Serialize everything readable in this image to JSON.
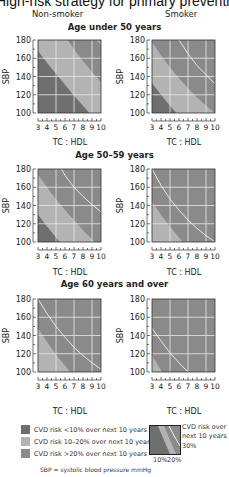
{
  "page": {
    "title": "High-risk strategy for primary prevention: a pro",
    "columns": [
      "Non-smoker",
      "Smoker"
    ],
    "age_groups": [
      "Age under 50 years",
      "Age 50–59 years",
      "Age 60 years and over"
    ],
    "x_axis_label": "TC : HDL",
    "y_axis_label": "SBP",
    "footnote": "SBP = systolic blood pressure mmHg"
  },
  "legend": {
    "items": [
      {
        "label": "CVD risk <10% over next 10 years",
        "color": "#6f6f6f"
      },
      {
        "label": "CVD risk 10–20% over next 10 years",
        "color": "#b3b3b3"
      },
      {
        "label": "CVD risk >20% over next 10 years",
        "color": "#8a8a8a"
      }
    ],
    "key": {
      "text_lines": [
        "CVD risk over",
        "next 10 years"
      ],
      "label_30": "30%",
      "label_10": "10%",
      "label_20": "20%"
    }
  },
  "colors": {
    "low": "#6f6f6f",
    "mid": "#b3b3b3",
    "high": "#8a8a8a",
    "grid": "#e8e8e8",
    "line30": "#f2f2f2"
  },
  "chart_data": [
    {
      "type": "area",
      "title": "Non-smoker, Age under 50 years",
      "xlabel": "TC : HDL",
      "ylabel": "SBP",
      "xlim": [
        3,
        10
      ],
      "ylim": [
        100,
        180
      ],
      "x_ticks": [
        3,
        4,
        5,
        6,
        7,
        8,
        9,
        10
      ],
      "y_ticks": [
        100,
        120,
        140,
        160,
        180
      ],
      "grid": true,
      "boundaries": {
        "10%": [
          [
            3,
            168
          ],
          [
            4,
            155
          ],
          [
            5,
            143
          ],
          [
            6,
            131
          ],
          [
            7,
            119
          ],
          [
            8,
            108
          ],
          [
            8.7,
            100
          ]
        ],
        "20%": [
          [
            6.3,
            180
          ],
          [
            7,
            170
          ],
          [
            8,
            157
          ],
          [
            9,
            145
          ],
          [
            10,
            134
          ]
        ],
        "30%": [
          [
            9.6,
            180
          ],
          [
            10,
            176
          ]
        ]
      }
    },
    {
      "type": "area",
      "title": "Smoker, Age under 50 years",
      "xlabel": "TC : HDL",
      "ylabel": "SBP",
      "xlim": [
        3,
        10
      ],
      "ylim": [
        100,
        180
      ],
      "x_ticks": [
        3,
        4,
        5,
        6,
        7,
        8,
        9,
        10
      ],
      "y_ticks": [
        100,
        120,
        140,
        160,
        180
      ],
      "grid": true,
      "boundaries": {
        "10%": [
          [
            3,
            133
          ],
          [
            4,
            120
          ],
          [
            5,
            108
          ],
          [
            5.7,
            100
          ]
        ],
        "20%": [
          [
            3,
            178
          ],
          [
            4,
            163
          ],
          [
            5,
            150
          ],
          [
            6,
            138
          ],
          [
            7,
            127
          ],
          [
            8,
            117
          ],
          [
            9,
            108
          ],
          [
            10,
            100
          ]
        ],
        "30%": [
          [
            6,
            180
          ],
          [
            7,
            165
          ],
          [
            8,
            152
          ],
          [
            9,
            142
          ],
          [
            10,
            132
          ]
        ]
      }
    },
    {
      "type": "area",
      "title": "Non-smoker, Age 50–59 years",
      "xlabel": "TC : HDL",
      "ylabel": "SBP",
      "xlim": [
        3,
        10
      ],
      "ylim": [
        100,
        180
      ],
      "x_ticks": [
        3,
        4,
        5,
        6,
        7,
        8,
        9,
        10
      ],
      "y_ticks": [
        100,
        120,
        140,
        160,
        180
      ],
      "grid": true,
      "boundaries": {
        "10%": [
          [
            3,
            130
          ],
          [
            4,
            117
          ],
          [
            5,
            105
          ],
          [
            5.4,
            100
          ]
        ],
        "20%": [
          [
            3,
            174
          ],
          [
            4,
            160
          ],
          [
            5,
            147
          ],
          [
            6,
            135
          ],
          [
            7,
            124
          ],
          [
            8,
            113
          ],
          [
            9,
            103
          ],
          [
            9.3,
            100
          ]
        ],
        "30%": [
          [
            5.6,
            180
          ],
          [
            6,
            173
          ],
          [
            7,
            160
          ],
          [
            8,
            150
          ],
          [
            9,
            141
          ],
          [
            10,
            133
          ]
        ]
      }
    },
    {
      "type": "area",
      "title": "Smoker, Age 50–59 years",
      "xlabel": "TC : HDL",
      "ylabel": "SBP",
      "xlim": [
        3,
        10
      ],
      "ylim": [
        100,
        180
      ],
      "x_ticks": [
        3,
        4,
        5,
        6,
        7,
        8,
        9,
        10
      ],
      "y_ticks": [
        100,
        120,
        140,
        160,
        180
      ],
      "grid": true,
      "boundaries": {
        "10%": [],
        "20%": [
          [
            3,
            144
          ],
          [
            4,
            130
          ],
          [
            5,
            117
          ],
          [
            6,
            105
          ],
          [
            6.4,
            100
          ]
        ],
        "30%": [
          [
            3,
            180
          ],
          [
            4,
            162
          ],
          [
            5,
            147
          ],
          [
            6,
            135
          ],
          [
            7,
            124
          ],
          [
            8,
            115
          ],
          [
            9,
            107
          ],
          [
            10,
            100
          ]
        ]
      }
    },
    {
      "type": "area",
      "title": "Non-smoker, Age 60 years and over",
      "xlabel": "TC : HDL",
      "ylabel": "SBP",
      "xlim": [
        3,
        10
      ],
      "ylim": [
        100,
        180
      ],
      "x_ticks": [
        3,
        4,
        5,
        6,
        7,
        8,
        9,
        10
      ],
      "y_ticks": [
        100,
        120,
        140,
        160,
        180
      ],
      "grid": true,
      "boundaries": {
        "10%": [],
        "20%": [
          [
            3,
            148
          ],
          [
            4,
            133
          ],
          [
            5,
            119
          ],
          [
            6,
            107
          ],
          [
            6.6,
            100
          ]
        ],
        "30%": [
          [
            3,
            180
          ],
          [
            4,
            164
          ],
          [
            5,
            150
          ],
          [
            6,
            138
          ],
          [
            7,
            127
          ],
          [
            8,
            118
          ],
          [
            9,
            110
          ],
          [
            10,
            103
          ]
        ]
      }
    },
    {
      "type": "area",
      "title": "Smoker, Age 60 years and over",
      "xlabel": "TC : HDL",
      "ylabel": "SBP",
      "xlim": [
        3,
        10
      ],
      "ylim": [
        100,
        180
      ],
      "x_ticks": [
        3,
        4,
        5,
        6,
        7,
        8,
        9,
        10
      ],
      "y_ticks": [
        100,
        120,
        140,
        160,
        180
      ],
      "grid": true,
      "boundaries": {
        "10%": [],
        "20%": [
          [
            3,
            118
          ],
          [
            3.5,
            110
          ],
          [
            4,
            102
          ],
          [
            4.1,
            100
          ]
        ],
        "30%": [
          [
            3,
            148
          ],
          [
            4,
            134
          ],
          [
            5,
            121
          ],
          [
            6,
            110
          ],
          [
            7,
            100
          ]
        ]
      }
    }
  ]
}
